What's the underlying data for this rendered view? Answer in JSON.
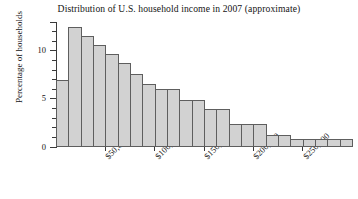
{
  "chart_data": {
    "type": "bar",
    "title": "Distribution of U.S. household income in 2007 (approximate)",
    "xlabel": "",
    "ylabel": "Percentage of households",
    "ylim": [
      0,
      13
    ],
    "xlim": [
      0,
      300000
    ],
    "grid": false,
    "legend": null,
    "bin_width": 12500,
    "y_ticks_major": [
      0,
      5,
      10
    ],
    "y_tick_labels": [
      "0",
      "5",
      "10"
    ],
    "y_ticks_minor": [
      1,
      2,
      3,
      4,
      6,
      7,
      8,
      9,
      11,
      12,
      13
    ],
    "x_ticks": [
      50000,
      100000,
      150000,
      200000,
      250000
    ],
    "x_tick_labels": [
      "$50,000",
      "$100,000",
      "$150,000",
      "$200,000",
      "$250,000"
    ],
    "categories": [
      "0-12,500",
      "12,500-25,000",
      "25,000-37,500",
      "37,500-50,000",
      "50,000-62,500",
      "62,500-75,000",
      "75,000-87,500",
      "87,500-100,000",
      "100,000-112,500",
      "112,500-125,000",
      "125,000-137,500",
      "137,500-150,000",
      "150,000-162,500",
      "162,500-175,000",
      "175,000-187,500",
      "187,500-200,000",
      "200,000-212,500",
      "212,500-225,000",
      "225,000-237,500",
      "237,500-250,000",
      "250,000-262,500",
      "262,500-275,000",
      "275,000-287,500",
      "287,500-300,000"
    ],
    "values": [
      7.0,
      12.5,
      11.5,
      10.6,
      9.7,
      8.7,
      7.6,
      6.6,
      6.0,
      6.0,
      4.9,
      4.9,
      4.0,
      4.0,
      2.4,
      2.4,
      2.4,
      1.2,
      1.2,
      0.8,
      0.8,
      0.8,
      0.8,
      0.8
    ],
    "bar_fill_color": "#d2d2d2",
    "bar_edge_color": "#5e5e5e",
    "axis_color": "#3a3a3a",
    "background_color": "#ffffff"
  }
}
